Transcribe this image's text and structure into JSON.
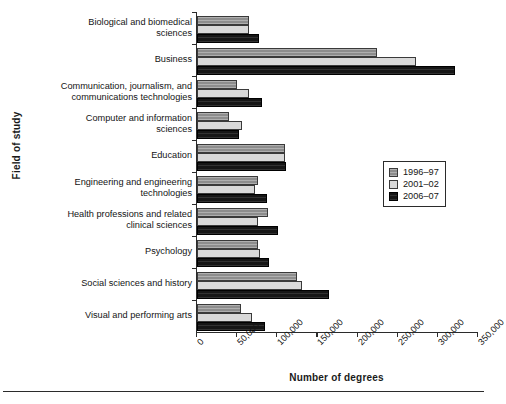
{
  "chart_data": {
    "type": "bar",
    "orientation": "horizontal",
    "title": "",
    "xlabel": "Number of degrees",
    "ylabel": "Field of study",
    "xlim": [
      0,
      350000
    ],
    "xtick_labels": [
      "0",
      "50,000",
      "100,000",
      "150,000",
      "200,000",
      "250,000",
      "300,000",
      "350,000"
    ],
    "xticks": [
      0,
      50000,
      100000,
      150000,
      200000,
      250000,
      300000,
      350000
    ],
    "grid": false,
    "legend_position": "center-right",
    "categories": [
      "Biological and biomedical sciences",
      "Business",
      "Communication, journalism, and communications technologies",
      "Computer and information sciences",
      "Education",
      "Engineering and engineering technologies",
      "Health professions and related clinical sciences",
      "Psychology",
      "Social sciences and history",
      "Visual and performing arts"
    ],
    "category_lines": [
      [
        "Biological and biomedical",
        "sciences"
      ],
      [
        "Business"
      ],
      [
        "Communication, journalism, and",
        "communications technologies"
      ],
      [
        "Computer and information",
        "sciences"
      ],
      [
        "Education"
      ],
      [
        "Engineering and engineering",
        "technologies"
      ],
      [
        "Health professions and related",
        "clinical sciences"
      ],
      [
        "Psychology"
      ],
      [
        "Social sciences and history"
      ],
      [
        "Visual and performing arts"
      ]
    ],
    "series": [
      {
        "name": "1996–97",
        "color": "#8d8d8d",
        "values": [
          65000,
          224000,
          50000,
          40000,
          110000,
          76000,
          89000,
          76000,
          125000,
          55000
        ]
      },
      {
        "name": "2001–02",
        "color": "#d9d9d9",
        "values": [
          65000,
          273000,
          65000,
          56000,
          109000,
          72000,
          76000,
          79000,
          131000,
          69000
        ]
      },
      {
        "name": "2006–07",
        "color": "#161616",
        "values": [
          77500,
          321000,
          81000,
          52000,
          111000,
          87000,
          101000,
          90000,
          165000,
          85000
        ]
      }
    ]
  },
  "legend": {
    "entries": [
      "1996–97",
      "2001–02",
      "2006–07"
    ]
  }
}
